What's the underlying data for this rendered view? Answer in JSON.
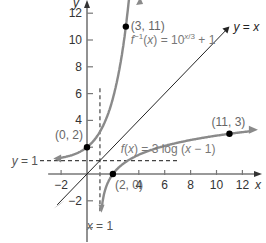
{
  "chart_data": {
    "type": "line",
    "title": "",
    "xlabel": "x",
    "ylabel": "y",
    "xlim": [
      -3,
      13
    ],
    "ylim": [
      -5,
      13
    ],
    "grid": false,
    "x_ticks": [
      -2,
      4,
      6,
      8,
      10,
      12
    ],
    "y_ticks": [
      12,
      10,
      8,
      6,
      4,
      -2
    ],
    "series": [
      {
        "name": "f^{-1}(x) = 10^{x/3} + 1",
        "label": "f⁻¹(x) = 10",
        "exp": "x/3",
        "tail": " + 1",
        "color": "#8a8a8a"
      },
      {
        "name": "f(x) = 3 log (x − 1)",
        "label": "f(x) = 3 log (x − 1)",
        "color": "#8a8a8a"
      },
      {
        "name": "y = x",
        "label": "y = x",
        "color": "#222222"
      }
    ],
    "asymptotes": [
      {
        "label": "y = 1",
        "type": "horizontal",
        "value": 1
      },
      {
        "label": "x = 1",
        "type": "vertical",
        "value": 1
      }
    ],
    "points": [
      {
        "label": "(3, 11)",
        "x": 3,
        "y": 11
      },
      {
        "label": "(0, 2)",
        "x": 0,
        "y": 2
      },
      {
        "label": "(2, 0)",
        "x": 2,
        "y": 0
      },
      {
        "label": "(11, 3)",
        "x": 11,
        "y": 3
      }
    ]
  },
  "axes": {
    "x_label": "x",
    "y_label": "y"
  }
}
